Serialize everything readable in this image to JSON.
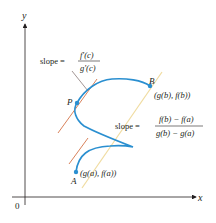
{
  "figure": {
    "axes": {
      "x_label": "x",
      "y_label": "y",
      "origin_label": "0"
    },
    "points": {
      "A": {
        "name": "A",
        "coords": "(g(a), f(a))"
      },
      "B": {
        "name": "B",
        "coords": "(g(b), f(b))"
      },
      "P": {
        "name": "P"
      }
    },
    "tangent_label": {
      "prefix": "slope =",
      "numerator": "f′(c)",
      "denominator": "g′(c)"
    },
    "secant_label": {
      "prefix": "slope =",
      "numerator": "f(b) − f(a)",
      "denominator": "g(b) − g(a)"
    },
    "colors": {
      "curve": "#2a8fd0",
      "tangent": "#d9825b",
      "secant": "#f0dca0",
      "axis": "#231f20",
      "leader": "#8a7a78"
    }
  }
}
